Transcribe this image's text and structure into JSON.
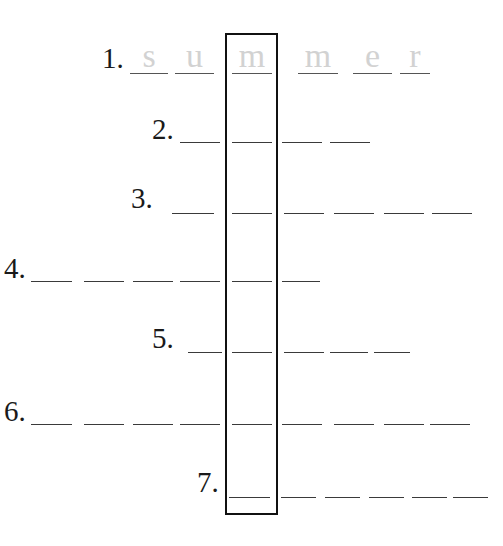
{
  "puzzle": {
    "title": "",
    "highlight_column_letter_index_note": "boxed column",
    "rows": [
      {
        "number": "1.",
        "label_x": 102,
        "label_y": 44,
        "underline_y": 73,
        "letters": [
          "s",
          "u",
          "m",
          "m",
          "e",
          "r"
        ],
        "blanks": [
          [
            130,
            168
          ],
          [
            175,
            214
          ],
          [
            232,
            272
          ],
          [
            298,
            338
          ],
          [
            353,
            392
          ],
          [
            400,
            430
          ]
        ]
      },
      {
        "number": "2.",
        "label_x": 152,
        "label_y": 115,
        "underline_y": 142,
        "letters": [
          "",
          "",
          "",
          ""
        ],
        "blanks": [
          [
            180,
            220
          ],
          [
            232,
            272
          ],
          [
            282,
            322
          ],
          [
            330,
            370
          ]
        ]
      },
      {
        "number": "3.",
        "label_x": 131,
        "label_y": 184,
        "underline_y": 213,
        "letters": [
          "",
          "",
          "",
          "",
          "",
          ""
        ],
        "blanks": [
          [
            172,
            214
          ],
          [
            232,
            272
          ],
          [
            284,
            324
          ],
          [
            334,
            374
          ],
          [
            384,
            424
          ],
          [
            432,
            472
          ]
        ]
      },
      {
        "number": "4.",
        "label_x": 4,
        "label_y": 254,
        "underline_y": 281,
        "letters": [
          "",
          "",
          "",
          "",
          "",
          ""
        ],
        "blanks": [
          [
            31,
            72
          ],
          [
            84,
            124
          ],
          [
            133,
            173
          ],
          [
            180,
            220
          ],
          [
            232,
            272
          ],
          [
            282,
            320
          ]
        ]
      },
      {
        "number": "5.",
        "label_x": 152,
        "label_y": 324,
        "underline_y": 352,
        "letters": [
          "",
          "",
          "",
          "",
          ""
        ],
        "blanks": [
          [
            188,
            222
          ],
          [
            232,
            272
          ],
          [
            284,
            324
          ],
          [
            330,
            368
          ],
          [
            374,
            410
          ]
        ]
      },
      {
        "number": "6.",
        "label_x": 4,
        "label_y": 397,
        "underline_y": 424,
        "letters": [
          "",
          "",
          "",
          "",
          "",
          "",
          "",
          "",
          ""
        ],
        "blanks": [
          [
            31,
            72
          ],
          [
            84,
            124
          ],
          [
            133,
            173
          ],
          [
            180,
            220
          ],
          [
            232,
            272
          ],
          [
            282,
            322
          ],
          [
            334,
            374
          ],
          [
            384,
            424
          ],
          [
            430,
            470
          ]
        ]
      },
      {
        "number": "7.",
        "label_x": 197,
        "label_y": 468,
        "underline_y": 497,
        "letters": [
          "",
          "",
          "",
          "",
          "",
          ""
        ],
        "blanks": [
          [
            229,
            270
          ],
          [
            281,
            316
          ],
          [
            325,
            360
          ],
          [
            369,
            404
          ],
          [
            412,
            447
          ],
          [
            453,
            488
          ]
        ]
      }
    ],
    "colors": {
      "hint_letter": "#d2d2d2",
      "underline": "#3a3a3a",
      "box_border": "#111111",
      "label": "#1a1a1a"
    }
  }
}
